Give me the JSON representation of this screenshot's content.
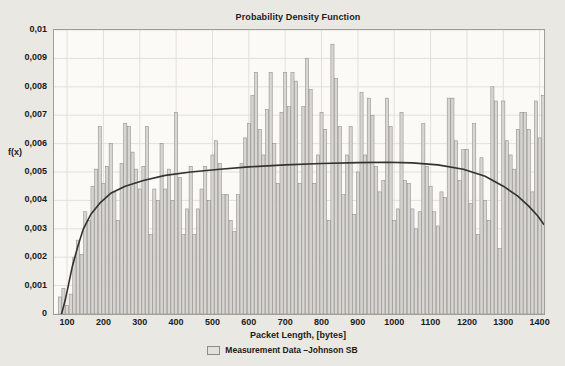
{
  "window": {
    "background_color": "#eae8e3"
  },
  "chart_data": {
    "type": "bar",
    "subtype": "histogram-with-fit-line",
    "title": "Probability Density Function",
    "xlabel": "Packet Length, [bytes]",
    "ylabel": "f(x)",
    "legend_entries": [
      {
        "label": "Measurement Data –Johnson SB",
        "marker": "histogram-bar-swatch"
      }
    ],
    "legend_position": "bottom-center",
    "grid": true,
    "x_range": [
      64,
      1412
    ],
    "y_range": [
      0,
      0.01
    ],
    "x_ticks": {
      "labels": [
        "100",
        "200",
        "300",
        "400",
        "500",
        "600",
        "700",
        "800",
        "900",
        "1000",
        "1100",
        "1200",
        "1300",
        "1400"
      ],
      "values": [
        100,
        200,
        300,
        400,
        500,
        600,
        700,
        800,
        900,
        1000,
        1100,
        1200,
        1300,
        1400
      ]
    },
    "y_ticks": {
      "labels": [
        "0",
        "0,001",
        "0,002",
        "0,003",
        "0,004",
        "0,005",
        "0,006",
        "0,007",
        "0,008",
        "0,009",
        "0,01"
      ],
      "values": [
        0,
        0.001,
        0.002,
        0.003,
        0.004,
        0.005,
        0.006,
        0.007,
        0.008,
        0.009,
        0.01
      ]
    },
    "series": [
      {
        "name": "Measurement Data",
        "type": "histogram",
        "bin_start": 75,
        "bin_width": 10,
        "values": [
          0.0006,
          0.0009,
          0.0003,
          0.0007,
          0.002,
          0.0026,
          0.0021,
          0.0036,
          0.0033,
          0.0045,
          0.0051,
          0.0066,
          0.0046,
          0.0052,
          0.006,
          0.0043,
          0.0033,
          0.0053,
          0.0067,
          0.0066,
          0.0057,
          0.0051,
          0.0044,
          0.0052,
          0.0066,
          0.0028,
          0.0044,
          0.004,
          0.006,
          0.0044,
          0.0051,
          0.004,
          0.0071,
          0.0048,
          0.0028,
          0.0037,
          0.0052,
          0.0028,
          0.0037,
          0.0044,
          0.0052,
          0.004,
          0.0056,
          0.0061,
          0.0053,
          0.0042,
          0.0042,
          0.0033,
          0.0029,
          0.0042,
          0.0053,
          0.0062,
          0.0067,
          0.0077,
          0.0085,
          0.0065,
          0.0056,
          0.0072,
          0.0085,
          0.006,
          0.0046,
          0.0071,
          0.0085,
          0.0073,
          0.0085,
          0.0082,
          0.0046,
          0.0073,
          0.009,
          0.0079,
          0.0046,
          0.0056,
          0.0071,
          0.0065,
          0.0033,
          0.0095,
          0.0083,
          0.0066,
          0.0042,
          0.0056,
          0.0066,
          0.0035,
          0.005,
          0.0078,
          0.0056,
          0.0076,
          0.007,
          0.0052,
          0.0043,
          0.0047,
          0.0076,
          0.0066,
          0.0033,
          0.0037,
          0.0071,
          0.0047,
          0.0046,
          0.0037,
          0.003,
          0.0036,
          0.0067,
          0.0052,
          0.0045,
          0.0036,
          0.0031,
          0.0043,
          0.0041,
          0.0076,
          0.0076,
          0.0061,
          0.0047,
          0.0058,
          0.0058,
          0.0039,
          0.0067,
          0.0028,
          0.0055,
          0.004,
          0.0033,
          0.008,
          0.0075,
          0.0023,
          0.0075,
          0.0061,
          0.0056,
          0.0051,
          0.0065,
          0.0071,
          0.0071,
          0.0065,
          0.0043,
          0.0075,
          0.0062,
          0.0077
        ]
      },
      {
        "name": "Johnson SB fit",
        "type": "line",
        "points": [
          [
            85,
            0
          ],
          [
            95,
            0.0005
          ],
          [
            105,
            0.0011
          ],
          [
            115,
            0.0017
          ],
          [
            130,
            0.0024
          ],
          [
            145,
            0.003
          ],
          [
            165,
            0.0035
          ],
          [
            190,
            0.0039
          ],
          [
            220,
            0.00425
          ],
          [
            260,
            0.0045
          ],
          [
            310,
            0.0047
          ],
          [
            370,
            0.00488
          ],
          [
            440,
            0.005
          ],
          [
            520,
            0.0051
          ],
          [
            600,
            0.00518
          ],
          [
            700,
            0.00525
          ],
          [
            800,
            0.0053
          ],
          [
            900,
            0.00533
          ],
          [
            980,
            0.00534
          ],
          [
            1050,
            0.00532
          ],
          [
            1120,
            0.00525
          ],
          [
            1190,
            0.0051
          ],
          [
            1250,
            0.00485
          ],
          [
            1300,
            0.0045
          ],
          [
            1340,
            0.00415
          ],
          [
            1370,
            0.0038
          ],
          [
            1395,
            0.00345
          ],
          [
            1412,
            0.00315
          ]
        ]
      }
    ],
    "colors": {
      "bar_fill": "#d8d6d2",
      "bar_stroke": "#8d8b88",
      "curve": "#333231",
      "grid": "#e2e0da",
      "frame": "#a09e9a",
      "plot_background": "#fbfaf7",
      "text": "#1c1b1a"
    }
  }
}
